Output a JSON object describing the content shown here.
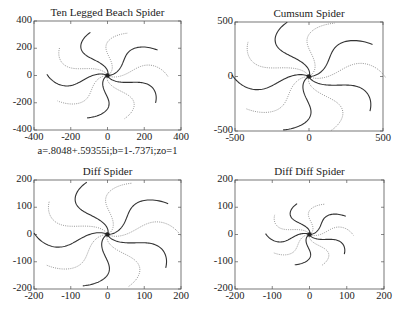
{
  "chart_data": [
    {
      "type": "line",
      "title": "Ten Legged Beach Spider",
      "xlim": [
        -400,
        400
      ],
      "ylim": [
        -400,
        400
      ],
      "xticks": [
        "-400",
        "-200",
        "0",
        "200",
        "400"
      ],
      "yticks": [
        "400",
        "200",
        "0",
        "-200",
        "-400"
      ],
      "arms": 10,
      "arm_radius": 330,
      "xlabel": "",
      "ylabel": "",
      "caption": "a=.8048+.59355i;b=1-.737i;zo=1",
      "box": {
        "left": 34,
        "top": 21,
        "right": 181,
        "bottom": 130
      }
    },
    {
      "type": "line",
      "title": "Cumsum Spider",
      "xlim": [
        -500,
        500
      ],
      "ylim": [
        -500,
        500
      ],
      "xticks": [
        "-500",
        "0",
        "500"
      ],
      "yticks": [
        "500",
        "0",
        "-500"
      ],
      "arms": 10,
      "arm_radius": 520,
      "xlabel": "",
      "ylabel": "",
      "box": {
        "left": 235,
        "top": 22,
        "right": 383,
        "bottom": 131
      }
    },
    {
      "type": "line",
      "title": "Diff Spider",
      "xlim": [
        -200,
        200
      ],
      "ylim": [
        -200,
        200
      ],
      "xticks": [
        "-200",
        "-100",
        "0",
        "100",
        "200"
      ],
      "yticks": [
        "200",
        "100",
        "0",
        "-100",
        "-200"
      ],
      "arms": 10,
      "arm_radius": 200,
      "xlabel": "",
      "ylabel": "",
      "box": {
        "left": 34,
        "top": 180,
        "right": 181,
        "bottom": 289
      }
    },
    {
      "type": "line",
      "title": "Diff Diff Spider",
      "xlim": [
        -200,
        200
      ],
      "ylim": [
        -200,
        200
      ],
      "xticks": [
        "-200",
        "-100",
        "0",
        "100",
        "200"
      ],
      "yticks": [
        "200",
        "100",
        "0",
        "-100",
        "-200"
      ],
      "arms": 10,
      "arm_radius": 118,
      "xlabel": "",
      "ylabel": "",
      "box": {
        "left": 235,
        "top": 180,
        "right": 384,
        "bottom": 289
      }
    }
  ],
  "style": {
    "axis_color": "#555555",
    "dark_arm": "#333333",
    "light_arm": "#888888"
  }
}
